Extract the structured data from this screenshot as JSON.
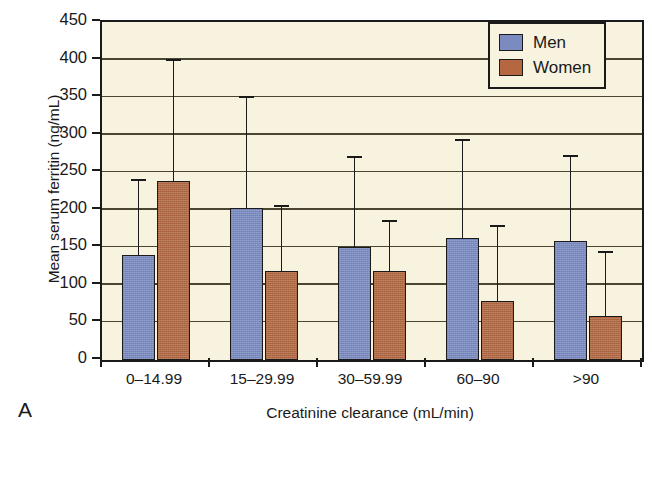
{
  "panel": {
    "letter": "A"
  },
  "legend": {
    "position": "top-right",
    "entries": [
      {
        "label": "Men",
        "color": "#7b8bc0"
      },
      {
        "label": "Women",
        "color": "#b5683f"
      }
    ]
  },
  "axes": {
    "ylabel": "Mean serum ferritin (ng/mL)",
    "xlabel": "Creatinine clearance (mL/min)",
    "yticks": [
      0,
      50,
      100,
      150,
      200,
      250,
      300,
      350,
      400,
      450
    ],
    "ylim": [
      0,
      450
    ],
    "grid": true
  },
  "chart_data": {
    "type": "bar",
    "title": "",
    "xlabel": "Creatinine clearance (mL/min)",
    "ylabel": "Mean serum ferritin (ng/mL)",
    "ylim": [
      0,
      450
    ],
    "yticks": [
      0,
      50,
      100,
      150,
      200,
      250,
      300,
      350,
      400,
      450
    ],
    "grid": true,
    "legend_position": "top-right",
    "categories": [
      "0–14.99",
      "15–29.99",
      "30–59.99",
      "60–90",
      ">90"
    ],
    "series": [
      {
        "name": "Men",
        "color": "#7b8bc0",
        "values": [
          140,
          203,
          150,
          163,
          158
        ],
        "error_upper": [
          240,
          350,
          270,
          293,
          272
        ]
      },
      {
        "name": "Women",
        "color": "#b5683f",
        "values": [
          238,
          118,
          118,
          78,
          59
        ],
        "error_upper": [
          400,
          205,
          185,
          178,
          144
        ]
      }
    ]
  }
}
